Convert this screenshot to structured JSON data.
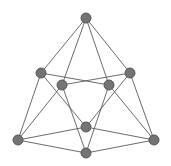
{
  "graph": {
    "style": {
      "node_fill": "#747474",
      "node_stroke": "#4e4e4e",
      "edge_color": "#5a5a5a",
      "node_radius": 5,
      "background": "#ffffff"
    },
    "nodes": [
      {
        "id": "top",
        "x": 86,
        "y": 18
      },
      {
        "id": "left-outer",
        "x": 41,
        "y": 73
      },
      {
        "id": "right-outer",
        "x": 130,
        "y": 73
      },
      {
        "id": "inner-left",
        "x": 62,
        "y": 85
      },
      {
        "id": "inner-right",
        "x": 109,
        "y": 85
      },
      {
        "id": "center-upper",
        "x": 86,
        "y": 127
      },
      {
        "id": "bottom-left",
        "x": 18,
        "y": 140
      },
      {
        "id": "bottom-right",
        "x": 154,
        "y": 140
      },
      {
        "id": "center-lower",
        "x": 86,
        "y": 153
      }
    ],
    "edges": [
      [
        "top",
        "left-outer"
      ],
      [
        "top",
        "inner-left"
      ],
      [
        "top",
        "inner-right"
      ],
      [
        "top",
        "right-outer"
      ],
      [
        "left-outer",
        "inner-right"
      ],
      [
        "left-outer",
        "center-upper"
      ],
      [
        "left-outer",
        "bottom-left"
      ],
      [
        "right-outer",
        "inner-left"
      ],
      [
        "right-outer",
        "center-upper"
      ],
      [
        "right-outer",
        "bottom-right"
      ],
      [
        "inner-left",
        "bottom-left"
      ],
      [
        "inner-left",
        "center-lower"
      ],
      [
        "inner-right",
        "bottom-right"
      ],
      [
        "inner-right",
        "center-lower"
      ],
      [
        "bottom-left",
        "center-upper"
      ],
      [
        "bottom-left",
        "center-lower"
      ],
      [
        "bottom-right",
        "center-upper"
      ],
      [
        "bottom-right",
        "center-lower"
      ]
    ]
  }
}
